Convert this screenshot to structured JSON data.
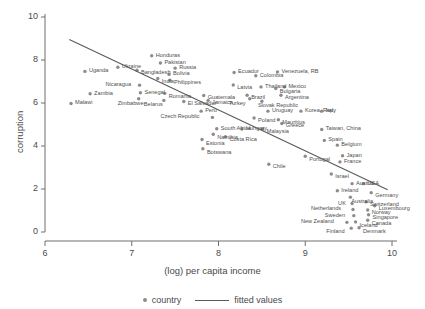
{
  "chart_data": {
    "type": "scatter",
    "title": "",
    "xlabel": "(log) per capita income",
    "ylabel": "corruption",
    "xlim": [
      6,
      10
    ],
    "ylim": [
      0,
      10
    ],
    "xticks": [
      "6",
      "7",
      "8",
      "9",
      "10"
    ],
    "yticks": [
      "0",
      "2",
      "4",
      "6",
      "8",
      "10"
    ],
    "grid": false,
    "legend": [
      {
        "key": "country",
        "marker": "dot"
      },
      {
        "key": "fitted values",
        "marker": "line"
      }
    ],
    "legend_position": "bottom",
    "fitted_line": {
      "x0": 6.28,
      "y0": 8.95,
      "x1": 9.95,
      "y1": 1.97
    },
    "marker_color": "#8c8c8c",
    "line_color": "#5a5a5a",
    "points": [
      {
        "name": "Malawi",
        "x": 6.3,
        "y": 5.98,
        "lx": 4,
        "ly": -2
      },
      {
        "name": "Uganda",
        "x": 6.46,
        "y": 7.47,
        "lx": 4,
        "ly": -2
      },
      {
        "name": "Zambia",
        "x": 6.52,
        "y": 6.43,
        "lx": 4,
        "ly": -2
      },
      {
        "name": "Zimbabwe",
        "x": 7.08,
        "y": 6.2,
        "lx": -21,
        "ly": 3
      },
      {
        "name": "Nicaragua",
        "x": 7.09,
        "y": 6.83,
        "lx": -34,
        "ly": -2
      },
      {
        "name": "Senegal",
        "x": 7.1,
        "y": 6.48,
        "lx": 4,
        "ly": -2
      },
      {
        "name": "Ukraine",
        "x": 6.84,
        "y": 7.66,
        "lx": 4,
        "ly": -2
      },
      {
        "name": "Bangladesh",
        "x": 7.06,
        "y": 7.52,
        "lx": 4,
        "ly": 1
      },
      {
        "name": "India",
        "x": 7.3,
        "y": 7.14,
        "lx": 4,
        "ly": 2
      },
      {
        "name": "Honduras",
        "x": 7.23,
        "y": 8.2,
        "lx": 4,
        "ly": -2
      },
      {
        "name": "Pakistan",
        "x": 7.33,
        "y": 7.86,
        "lx": 4,
        "ly": -2
      },
      {
        "name": "Romania",
        "x": 7.38,
        "y": 6.45,
        "lx": 4,
        "ly": 2
      },
      {
        "name": "Belarus",
        "x": 7.37,
        "y": 6.12,
        "lx": -20,
        "ly": 3
      },
      {
        "name": "Bolivia",
        "x": 7.43,
        "y": 7.33,
        "lx": 4,
        "ly": -2
      },
      {
        "name": "Philippines",
        "x": 7.44,
        "y": 7.06,
        "lx": 4,
        "ly": 1
      },
      {
        "name": "Russia",
        "x": 7.5,
        "y": 7.62,
        "lx": 4,
        "ly": -2
      },
      {
        "name": "El Salvador",
        "x": 7.6,
        "y": 6.07,
        "lx": 4,
        "ly": 1
      },
      {
        "name": "Peru",
        "x": 7.8,
        "y": 5.62,
        "lx": 4,
        "ly": -2
      },
      {
        "name": "Guatemala",
        "x": 7.83,
        "y": 6.35,
        "lx": 4,
        "ly": 1
      },
      {
        "name": "Jamaica",
        "x": 7.88,
        "y": 6.12,
        "lx": 4,
        "ly": 1
      },
      {
        "name": "Czech Republic",
        "x": 7.93,
        "y": 5.33,
        "lx": -52,
        "ly": -2
      },
      {
        "name": "Estonia",
        "x": 7.81,
        "y": 4.3,
        "lx": 4,
        "ly": 2
      },
      {
        "name": "Botswana",
        "x": 7.82,
        "y": 3.87,
        "lx": 4,
        "ly": 2
      },
      {
        "name": "Namibia",
        "x": 7.94,
        "y": 4.55,
        "lx": 4,
        "ly": 2
      },
      {
        "name": "South Africa",
        "x": 7.98,
        "y": 4.8,
        "lx": 4,
        "ly": -2
      },
      {
        "name": "Costa Rica",
        "x": 8.08,
        "y": 4.43,
        "lx": 4,
        "ly": 1
      },
      {
        "name": "Latvia",
        "x": 8.17,
        "y": 6.84,
        "lx": 4,
        "ly": 1
      },
      {
        "name": "Ecuador",
        "x": 8.18,
        "y": 7.42,
        "lx": 4,
        "ly": -2
      },
      {
        "name": "Hungary",
        "x": 8.27,
        "y": 4.79,
        "lx": 4,
        "ly": -2
      },
      {
        "name": "Brazil",
        "x": 8.33,
        "y": 6.36,
        "lx": 4,
        "ly": 1
      },
      {
        "name": "Turkey",
        "x": 8.36,
        "y": 6.2,
        "lx": -21,
        "ly": 3
      },
      {
        "name": "Poland",
        "x": 8.41,
        "y": 5.3,
        "lx": 4,
        "ly": 1
      },
      {
        "name": "Colombia",
        "x": 8.43,
        "y": 7.27,
        "lx": 4,
        "ly": -2
      },
      {
        "name": "Thailand",
        "x": 8.49,
        "y": 6.75,
        "lx": 4,
        "ly": -2
      },
      {
        "name": "Slovak Republic",
        "x": 8.5,
        "y": 6.08,
        "lx": -4,
        "ly": 3
      },
      {
        "name": "Malaysia",
        "x": 8.51,
        "y": 4.79,
        "lx": 4,
        "ly": 1
      },
      {
        "name": "Uruguay",
        "x": 8.57,
        "y": 5.62,
        "lx": 4,
        "ly": -2
      },
      {
        "name": "Chile",
        "x": 8.58,
        "y": 3.15,
        "lx": 4,
        "ly": 1
      },
      {
        "name": "Bulgaria",
        "x": 8.66,
        "y": 6.67,
        "lx": 4,
        "ly": 1
      },
      {
        "name": "Venezuela, RB",
        "x": 8.68,
        "y": 7.45,
        "lx": 4,
        "ly": -2
      },
      {
        "name": "Mauritius",
        "x": 8.69,
        "y": 5.22,
        "lx": 4,
        "ly": 1
      },
      {
        "name": "Greece",
        "x": 8.73,
        "y": 5.05,
        "lx": 4,
        "ly": 1
      },
      {
        "name": "Argentina",
        "x": 8.72,
        "y": 6.36,
        "lx": 4,
        "ly": 1
      },
      {
        "name": "Mexico",
        "x": 8.76,
        "y": 6.75,
        "lx": 4,
        "ly": -2
      },
      {
        "name": "Korea, Rep.",
        "x": 8.95,
        "y": 5.62,
        "lx": 4,
        "ly": -2
      },
      {
        "name": "Portugal",
        "x": 9.0,
        "y": 3.52,
        "lx": 4,
        "ly": 2
      },
      {
        "name": "Italy",
        "x": 9.19,
        "y": 5.62,
        "lx": 4,
        "ly": -2
      },
      {
        "name": "Taiwan, China",
        "x": 9.19,
        "y": 4.77,
        "lx": 4,
        "ly": -2
      },
      {
        "name": "Spain",
        "x": 9.22,
        "y": 4.26,
        "lx": 4,
        "ly": -2
      },
      {
        "name": "Israel",
        "x": 9.3,
        "y": 2.7,
        "lx": 4,
        "ly": 1
      },
      {
        "name": "Belgium",
        "x": 9.37,
        "y": 4.04,
        "lx": 4,
        "ly": -2
      },
      {
        "name": "Japan",
        "x": 9.43,
        "y": 3.55,
        "lx": 4,
        "ly": -2
      },
      {
        "name": "France",
        "x": 9.4,
        "y": 3.26,
        "lx": 4,
        "ly": -2
      },
      {
        "name": "Ireland",
        "x": 9.37,
        "y": 1.92,
        "lx": 4,
        "ly": -2
      },
      {
        "name": "Austria",
        "x": 9.54,
        "y": 2.25,
        "lx": 4,
        "ly": -2
      },
      {
        "name": "USA",
        "x": 9.67,
        "y": 2.25,
        "lx": 4,
        "ly": -2
      },
      {
        "name": "Australia",
        "x": 9.52,
        "y": 1.62,
        "lx": 1,
        "ly": 3
      },
      {
        "name": "Germany",
        "x": 9.76,
        "y": 1.83,
        "lx": 4,
        "ly": 1
      },
      {
        "name": "UK",
        "x": 9.54,
        "y": 1.32,
        "lx": -14,
        "ly": -2
      },
      {
        "name": "Switzerland",
        "x": 9.7,
        "y": 1.4,
        "lx": 4,
        "ly": 1
      },
      {
        "name": "Luxembourg",
        "x": 9.8,
        "y": 1.22,
        "lx": 4,
        "ly": 1
      },
      {
        "name": "Netherlands",
        "x": 9.55,
        "y": 1.05,
        "lx": -42,
        "ly": -2
      },
      {
        "name": "Norway",
        "x": 9.72,
        "y": 1.02,
        "lx": 4,
        "ly": 1
      },
      {
        "name": "Sweden",
        "x": 9.56,
        "y": 0.76,
        "lx": -29,
        "ly": -2
      },
      {
        "name": "Singapore",
        "x": 9.73,
        "y": 0.8,
        "lx": 4,
        "ly": 1
      },
      {
        "name": "Iceland",
        "x": 9.58,
        "y": 0.47,
        "lx": 4,
        "ly": 2
      },
      {
        "name": "Canada",
        "x": 9.72,
        "y": 0.55,
        "lx": 4,
        "ly": 2
      },
      {
        "name": "New Zealand",
        "x": 9.48,
        "y": 0.45,
        "lx": -46,
        "ly": -2
      },
      {
        "name": "Finland",
        "x": 9.53,
        "y": 0.18,
        "lx": -25,
        "ly": 2
      },
      {
        "name": "Denmark",
        "x": 9.62,
        "y": 0.2,
        "lx": 4,
        "ly": 2
      }
    ]
  }
}
